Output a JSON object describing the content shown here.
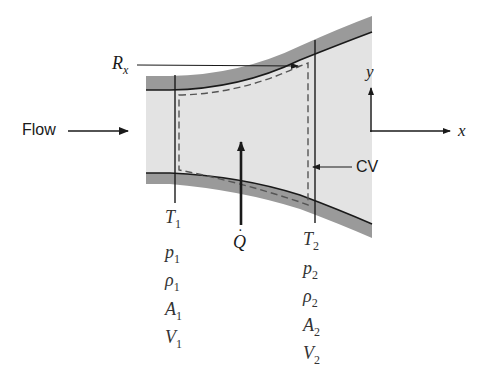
{
  "diagram": {
    "colors": {
      "fluid": "#e3e3e3",
      "wall": "#9a9a9a",
      "line": "#1a1a1a",
      "dash": "#555555"
    },
    "labels": {
      "flow": "Flow",
      "rx": "R",
      "rx_sub": "x",
      "cv": "CV",
      "q": "Q",
      "axis_x": "x",
      "axis_y": "y"
    },
    "station1": {
      "T": "T",
      "T_sub": "1",
      "p": "p",
      "p_sub": "1",
      "rho": "ρ",
      "rho_sub": "1",
      "A": "A",
      "A_sub": "1",
      "V": "V",
      "V_sub": "1"
    },
    "station2": {
      "T": "T",
      "T_sub": "2",
      "p": "p",
      "p_sub": "2",
      "rho": "ρ",
      "rho_sub": "2",
      "A": "A",
      "A_sub": "2",
      "V": "V",
      "V_sub": "2"
    }
  }
}
